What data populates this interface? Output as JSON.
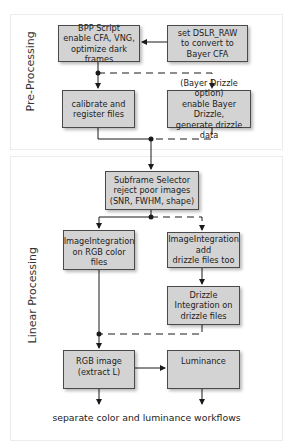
{
  "sections": {
    "pre_processing": "Pre-Processing",
    "linear_processing": "Linear Processing"
  },
  "nodes": {
    "bpp_script": "BPP Script\nenable CFA, VNG,\noptimize dark frames",
    "dslr_raw": "set DSLR_RAW\nto convert to\nBayer CFA",
    "calibrate": "calibrate and\nregister files",
    "bayer_drizzle": "(Bayer Drizzle option)\nenable Bayer Drizzle,\ngenerate drizzle data",
    "subframe_selector": "Subframe Selector\nreject poor images\n(SNR, FWHM, shape)",
    "imageintegration_rgb": "ImageIntegration\non RGB color files",
    "imageintegration_drizzle": "ImageIntegration\nadd\ndrizzle files too",
    "drizzle_integration": "Drizzle\nIntegration on\ndrizzle files",
    "rgb_image": "RGB image\n(extract L)",
    "luminance": "Luminance"
  },
  "caption": "separate color and luminance workflows",
  "colors": {
    "box_fill": "#d3d3d3",
    "box_border": "#4a4a4a",
    "line": "#1a1a1a"
  }
}
